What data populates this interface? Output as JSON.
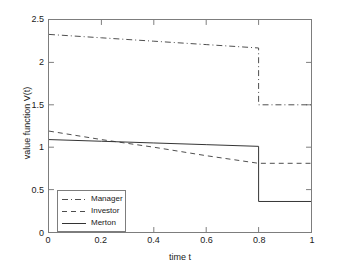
{
  "chart_data": {
    "type": "line",
    "title": "",
    "xlabel": "time t",
    "ylabel": "value function V(t)",
    "xlim": [
      0,
      1
    ],
    "ylim": [
      0,
      2.5
    ],
    "xticks": [
      "0",
      "0.2",
      "0.4",
      "0.6",
      "0.8",
      "1"
    ],
    "xtick_values": [
      0,
      0.2,
      0.4,
      0.6,
      0.8,
      1
    ],
    "yticks": [
      "0",
      "0.5",
      "1",
      "1.5",
      "2",
      "2.5"
    ],
    "ytick_values": [
      0,
      0.5,
      1,
      1.5,
      2,
      2.5
    ],
    "grid": false,
    "legend_position": "lower left",
    "jump_time": 0.8,
    "series": [
      {
        "name": "Manager",
        "style": "dash-dot",
        "color": "#4d4d4d",
        "x": [
          0,
          0.2,
          0.4,
          0.6,
          0.8,
          0.8,
          1.0
        ],
        "values": [
          2.33,
          2.29,
          2.25,
          2.21,
          2.17,
          1.5,
          1.5
        ]
      },
      {
        "name": "Investor",
        "style": "dashed",
        "color": "#4d4d4d",
        "x": [
          0,
          0.2,
          0.4,
          0.6,
          0.8,
          1.0
        ],
        "values": [
          1.19,
          1.09,
          1.0,
          0.9,
          0.81,
          0.81
        ]
      },
      {
        "name": "Merton",
        "style": "solid",
        "color": "#333333",
        "x": [
          0,
          0.2,
          0.4,
          0.6,
          0.8,
          0.8,
          1.0
        ],
        "values": [
          1.09,
          1.07,
          1.05,
          1.03,
          1.01,
          0.36,
          0.36
        ]
      }
    ]
  },
  "legend": {
    "items": [
      {
        "label": "Manager"
      },
      {
        "label": "Investor"
      },
      {
        "label": "Merton"
      }
    ]
  }
}
